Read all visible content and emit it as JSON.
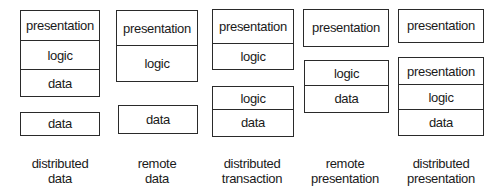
{
  "diagram": {
    "models": [
      {
        "caption_line1": "distributed",
        "caption_line2": "data",
        "top_stack": [
          "presentation",
          "logic",
          "data"
        ],
        "bottom_stack": [
          "data"
        ]
      },
      {
        "caption_line1": "remote",
        "caption_line2": "data",
        "top_stack": [
          "presentation",
          "logic"
        ],
        "bottom_stack": [
          "data"
        ]
      },
      {
        "caption_line1": "distributed",
        "caption_line2": "transaction",
        "top_stack": [
          "presentation",
          "logic"
        ],
        "bottom_stack": [
          "logic",
          "data"
        ]
      },
      {
        "caption_line1": "remote",
        "caption_line2": "presentation",
        "top_stack": [
          "presentation"
        ],
        "bottom_stack": [
          "logic",
          "data"
        ]
      },
      {
        "caption_line1": "distributed",
        "caption_line2": "presentation",
        "top_stack": [
          "presentation"
        ],
        "bottom_stack": [
          "presentation",
          "logic",
          "data"
        ]
      }
    ]
  },
  "colors": {
    "border": "#2a2a2a",
    "text": "#1a1a1a",
    "background": "#ffffff"
  }
}
